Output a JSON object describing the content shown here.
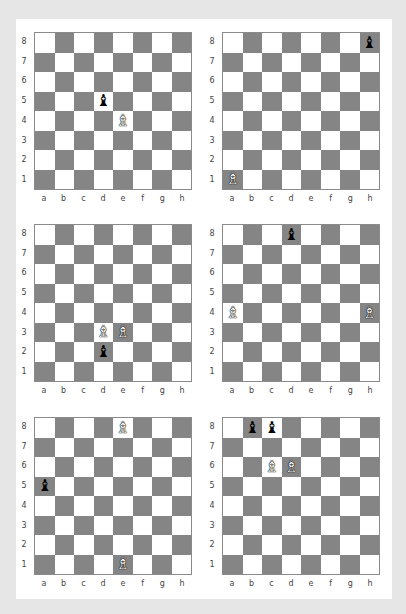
{
  "colors": {
    "background": "#e6e6e6",
    "panel": "#ffffff",
    "light_square": "#ffffff",
    "dark_square": "#858585"
  },
  "files": [
    "a",
    "b",
    "c",
    "d",
    "e",
    "f",
    "g",
    "h"
  ],
  "ranks": [
    "8",
    "7",
    "6",
    "5",
    "4",
    "3",
    "2",
    "1"
  ],
  "piece_glyphs": {
    "white_bishop": "♗",
    "black_bishop": "♝"
  },
  "diagrams": [
    {
      "id": 1,
      "pieces": [
        {
          "square": "d5",
          "type": "black_bishop"
        },
        {
          "square": "e4",
          "type": "white_bishop"
        }
      ]
    },
    {
      "id": 2,
      "pieces": [
        {
          "square": "h8",
          "type": "black_bishop"
        },
        {
          "square": "a1",
          "type": "white_bishop"
        }
      ]
    },
    {
      "id": 3,
      "pieces": [
        {
          "square": "d3",
          "type": "white_bishop"
        },
        {
          "square": "e3",
          "type": "white_bishop"
        },
        {
          "square": "d2",
          "type": "black_bishop"
        }
      ]
    },
    {
      "id": 4,
      "pieces": [
        {
          "square": "d8",
          "type": "black_bishop"
        },
        {
          "square": "a4",
          "type": "white_bishop"
        },
        {
          "square": "h4",
          "type": "white_bishop"
        }
      ]
    },
    {
      "id": 5,
      "pieces": [
        {
          "square": "e8",
          "type": "white_bishop"
        },
        {
          "square": "a5",
          "type": "black_bishop"
        },
        {
          "square": "e1",
          "type": "white_bishop"
        }
      ]
    },
    {
      "id": 6,
      "pieces": [
        {
          "square": "b8",
          "type": "black_bishop"
        },
        {
          "square": "c8",
          "type": "black_bishop"
        },
        {
          "square": "c6",
          "type": "white_bishop"
        },
        {
          "square": "d6",
          "type": "white_bishop"
        }
      ]
    }
  ]
}
